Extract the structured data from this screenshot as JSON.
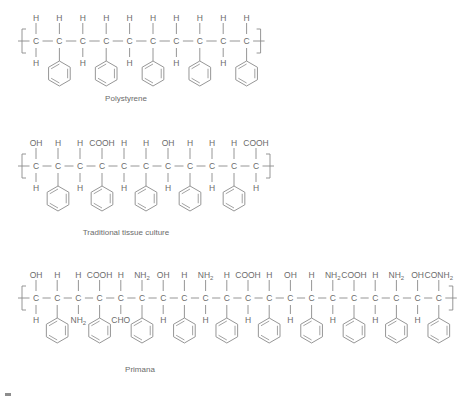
{
  "figure": {
    "background_color": "#ffffff",
    "line_color": "#8a8a8a",
    "text_color": "#6b6b6b"
  },
  "structures": [
    {
      "id": "polystyrene",
      "label": "Polystyrene",
      "backbone_carbons": 10,
      "carbon_symbol": "C",
      "left_bracket": true,
      "right_bracket": true,
      "top_substituents": [
        "H",
        "H",
        "H",
        "H",
        "H",
        "H",
        "H",
        "H",
        "H",
        "H"
      ],
      "bottom_substituents": [
        "H",
        "ring",
        "H",
        "ring",
        "H",
        "ring",
        "H",
        "ring",
        "H",
        "ring"
      ],
      "ring_label": "phenyl"
    },
    {
      "id": "traditional-tissue-culture",
      "label": "Traditional tissue culture",
      "backbone_carbons": 11,
      "carbon_symbol": "C",
      "left_bracket": true,
      "right_bracket": true,
      "top_substituents": [
        "OH",
        "H",
        "H",
        "COOH",
        "H",
        "H",
        "OH",
        "H",
        "H",
        "H",
        "COOH"
      ],
      "bottom_substituents": [
        "H",
        "ring",
        "H",
        "ring",
        "H",
        "ring",
        "H",
        "ring",
        "H",
        "ring",
        "H"
      ],
      "ring_label": "phenyl"
    },
    {
      "id": "primana",
      "label": "Primana",
      "backbone_carbons": 20,
      "carbon_symbol": "C",
      "left_bracket": true,
      "right_bracket": true,
      "top_substituents": [
        "OH",
        "H",
        "H",
        "COOH",
        "H",
        "NH2",
        "OH",
        "H",
        "NH2",
        "H",
        "COOH",
        "H",
        "OH",
        "H",
        "NH2",
        "COOH",
        "H",
        "NH2",
        "OH",
        "CONH2"
      ],
      "bottom_substituents": [
        "H",
        "ring",
        "NH2",
        "ring",
        "CHO",
        "ring",
        "H",
        "ring",
        "H",
        "ring",
        "H",
        "ring",
        "H",
        "ring",
        "H",
        "ring",
        "H",
        "ring",
        "H",
        "ring"
      ],
      "ring_label": "phenyl"
    }
  ],
  "functional_groups": {
    "H": {
      "text": "H",
      "sub": ""
    },
    "OH": {
      "text": "OH",
      "sub": ""
    },
    "COOH": {
      "text": "COOH",
      "sub": ""
    },
    "NH2": {
      "text": "NH",
      "sub": "2"
    },
    "CHO": {
      "text": "CHO",
      "sub": ""
    },
    "CONH2": {
      "text": "CONH",
      "sub": "2"
    }
  }
}
